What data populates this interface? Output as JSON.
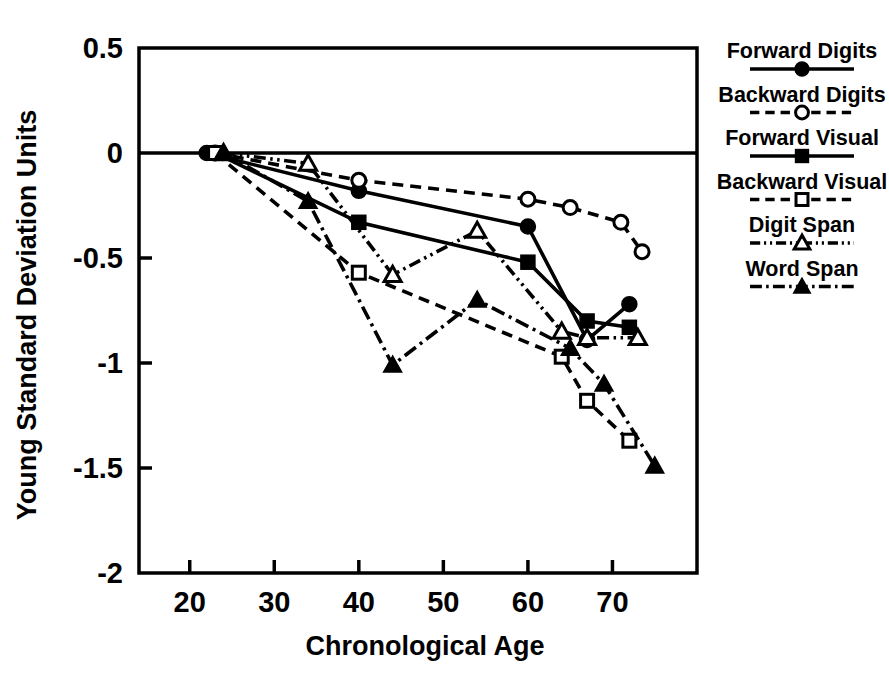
{
  "chart_data": {
    "type": "line",
    "title": "",
    "xlabel": "Chronological Age",
    "ylabel": "Young Standard Deviation Units",
    "xlim": [
      14,
      80
    ],
    "ylim": [
      -2,
      0.5
    ],
    "xticks": [
      20,
      30,
      40,
      50,
      60,
      70
    ],
    "yticks": [
      0.5,
      0,
      -0.5,
      -1,
      -1.5,
      -2
    ],
    "xtick_labels": [
      "20",
      "30",
      "40",
      "50",
      "60",
      "70"
    ],
    "ytick_labels": [
      "0.5",
      "0",
      "-0.5",
      "-1",
      "-1.5",
      "-2"
    ],
    "grid": false,
    "zero_line": true,
    "legend_position": "right",
    "series": [
      {
        "name": "Forward Digits",
        "marker": "filled-circle",
        "dash": "solid",
        "x": [
          22,
          40,
          60,
          67,
          72
        ],
        "y": [
          0.0,
          -0.18,
          -0.35,
          -0.89,
          -0.72
        ]
      },
      {
        "name": "Backward Digits",
        "marker": "open-circle",
        "dash": "dashed",
        "x": [
          23,
          40,
          60,
          65,
          71,
          73.5
        ],
        "y": [
          0.0,
          -0.13,
          -0.22,
          -0.26,
          -0.33,
          -0.47
        ]
      },
      {
        "name": "Forward Visual",
        "marker": "filled-square",
        "dash": "solid",
        "x": [
          23,
          40,
          60,
          67,
          72
        ],
        "y": [
          0.0,
          -0.33,
          -0.52,
          -0.8,
          -0.83
        ]
      },
      {
        "name": "Backward Visual",
        "marker": "open-square",
        "dash": "dashed",
        "x": [
          23,
          40,
          64,
          67,
          72
        ],
        "y": [
          0.0,
          -0.57,
          -0.97,
          -1.18,
          -1.37
        ]
      },
      {
        "name": "Digit Span",
        "marker": "open-triangle",
        "dash": "dash-dot-dot",
        "x": [
          24,
          34,
          44,
          54,
          64,
          67,
          73
        ],
        "y": [
          0.0,
          -0.05,
          -0.58,
          -0.37,
          -0.85,
          -0.88,
          -0.88
        ]
      },
      {
        "name": "Word Span",
        "marker": "filled-triangle",
        "dash": "dash-dot",
        "x": [
          24,
          34,
          44,
          54,
          65,
          69,
          75
        ],
        "y": [
          0.0,
          -0.23,
          -1.01,
          -0.7,
          -0.93,
          -1.1,
          -1.49
        ]
      }
    ],
    "legend_entries": [
      {
        "label": "Forward Digits",
        "marker": "filled-circle",
        "dash": "solid"
      },
      {
        "label": "Backward Digits",
        "marker": "open-circle",
        "dash": "dashed"
      },
      {
        "label": "Forward Visual",
        "marker": "filled-square",
        "dash": "solid"
      },
      {
        "label": "Backward Visual",
        "marker": "open-square",
        "dash": "dashed"
      },
      {
        "label": "Digit Span",
        "marker": "open-triangle",
        "dash": "dash-dot-dot"
      },
      {
        "label": "Word Span",
        "marker": "filled-triangle",
        "dash": "dash-dot"
      }
    ],
    "colors": {
      "ink": "#000000",
      "background": "#ffffff"
    }
  }
}
